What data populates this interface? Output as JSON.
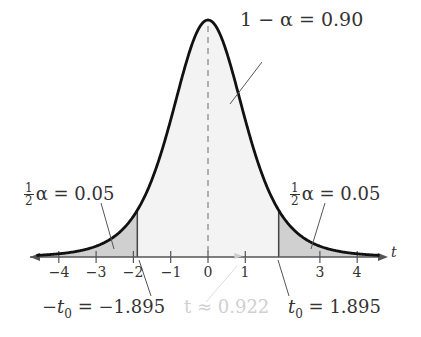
{
  "chart_data": {
    "type": "area",
    "title": "",
    "xlabel": "t",
    "ylabel": "",
    "xlim": [
      -4.6,
      4.6
    ],
    "x_ticks": [
      -4,
      -3,
      -2,
      -1,
      0,
      1,
      3,
      4
    ],
    "x_tick_labels": [
      "−4",
      "−3",
      "−2",
      "−1",
      "0",
      "1",
      "3",
      "4"
    ],
    "grid": false,
    "center_dashed_line_at": 0,
    "critical_values": {
      "left": -1.895,
      "right": 1.895
    },
    "test_statistic": 0.922,
    "regions": [
      {
        "name": "left tail",
        "from": -4.6,
        "to": -1.895,
        "area": 0.05,
        "shaded": true
      },
      {
        "name": "center",
        "from": -1.895,
        "to": 1.895,
        "area": 0.9,
        "shaded": "light"
      },
      {
        "name": "right tail",
        "from": 1.895,
        "to": 4.6,
        "area": 0.05,
        "shaded": true
      }
    ],
    "annotations": [
      "1 − α = 0.90",
      "½ α = 0.05",
      "½ α = 0.05",
      "−t0 = −1.895",
      "t ≈ 0.922",
      "t0 = 1.895"
    ]
  },
  "labels": {
    "center_area": "1 −  α = 0.90",
    "half_frac_num": "1",
    "half_frac_den": "2",
    "left_tail_text": "α = 0.05",
    "right_tail_text": "α = 0.05",
    "axis_var": "t",
    "neg_t0_prefix": "−t",
    "neg_t0_sub": "0",
    "neg_t0_value": " = −1.895",
    "t_stat": "t ≈ 0.922",
    "t0_prefix": "t",
    "t0_sub": "0",
    "t0_value": " = 1.895"
  },
  "ticks": [
    {
      "label": "−4",
      "x": 59
    },
    {
      "label": "−3",
      "x": 96
    },
    {
      "label": "−2",
      "x": 133
    },
    {
      "label": "−1",
      "x": 171
    },
    {
      "label": "0",
      "x": 208
    },
    {
      "label": "1",
      "x": 245
    },
    {
      "label": "3",
      "x": 320
    },
    {
      "label": "4",
      "x": 357
    }
  ]
}
